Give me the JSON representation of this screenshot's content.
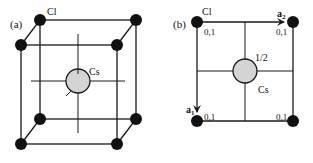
{
  "figure": {
    "panel_a": {
      "label": "(a)",
      "corner_atom_label": "Cl",
      "center_atom_label": "Cs"
    },
    "panel_b": {
      "label": "(b)",
      "corner_atom_label": "Cl",
      "center_atom_label": "Cs",
      "center_height_label": "1/2",
      "corner_height_labels": [
        "0,1",
        "0,1",
        "0,1",
        "0,1"
      ],
      "vector_a1_label": "a",
      "vector_a1_sub": "1",
      "vector_a2_label": "a",
      "vector_a2_sub": "2"
    },
    "colors": {
      "line": "#1a1a1a",
      "corner_atom": "#111111",
      "center_atom": "#d4d4d4"
    }
  }
}
